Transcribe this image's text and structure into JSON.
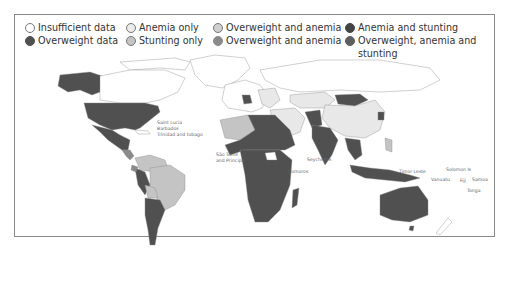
{
  "legend": {
    "items": [
      {
        "label": "Insufficient data",
        "color": "#ffffff"
      },
      {
        "label": "Anemia only",
        "color": "#e8e8e8"
      },
      {
        "label": "Overweight and anemia",
        "color": "#cfcfcf"
      },
      {
        "label": "Anemia and stunting",
        "color": "#4a4a4a"
      },
      {
        "label": "Overweight data",
        "color": "#505050"
      },
      {
        "label": "Stunting only",
        "color": "#c4c4c4"
      },
      {
        "label": "Overweight and anemia",
        "color": "#8a8a8a"
      },
      {
        "label": "Overweight, anemia and stunting",
        "color": "#5e5e5e"
      }
    ]
  },
  "map": {
    "labels": {
      "saint_lucia": "Saint Lucia",
      "barbados": "Barbados",
      "trinidad": "Trinidad and tobago",
      "sao_tome": "São Tomé",
      "sao_tome_2": "and Principe",
      "seychelles": "Seychelles",
      "comoros": "Comoros",
      "timor_leste": "Timor Leste",
      "solomon": "Solomon Is",
      "vanuatu": "Vanuatu",
      "fiji": "Fiji",
      "samoa": "Samoa",
      "tonga": "Tonga"
    }
  }
}
